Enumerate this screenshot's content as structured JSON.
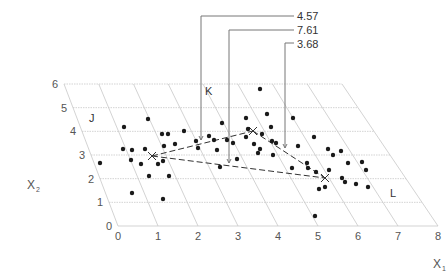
{
  "diagram": {
    "type": "3d-scatter-cluster-plane",
    "axes": {
      "x1": {
        "title": "X",
        "subscript": "1",
        "ticks": [
          "0",
          "1",
          "2",
          "3",
          "4",
          "5",
          "6",
          "7",
          "8"
        ]
      },
      "x2": {
        "title": "X",
        "subscript": "2",
        "ticks": [
          "0",
          "1",
          "2",
          "3",
          "4",
          "5",
          "6"
        ]
      }
    },
    "clusters": [
      {
        "name": "J",
        "label": "J"
      },
      {
        "name": "K",
        "label": "K"
      },
      {
        "name": "L",
        "label": "L"
      }
    ],
    "distances": [
      {
        "id": "d1",
        "value": "4.57"
      },
      {
        "id": "d2",
        "value": "7.61"
      },
      {
        "id": "d3",
        "value": "3.68"
      }
    ],
    "colors": {
      "points": "#1a1a1a",
      "grid": "#c8c8c8",
      "text": "#555555"
    }
  }
}
